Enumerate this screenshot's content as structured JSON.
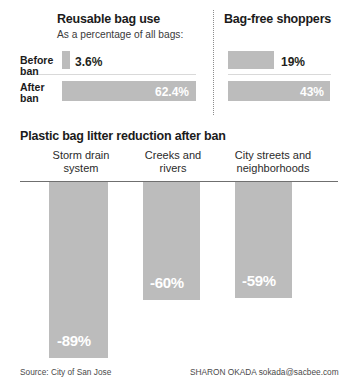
{
  "chart_data": [
    {
      "type": "bar",
      "orientation": "horizontal",
      "title": "Reusable bag use",
      "subtitle": "As a percentage of all bags:",
      "xlabel": "",
      "ylabel": "",
      "categories": [
        "Before ban",
        "After ban"
      ],
      "values": [
        3.6,
        62.4
      ],
      "value_labels": [
        "3.6%",
        "62.4%"
      ],
      "unit": "%",
      "xlim": [
        0,
        100
      ],
      "grid": false,
      "legend": "none",
      "bar_color": "#bcbcbc"
    },
    {
      "type": "bar",
      "orientation": "horizontal",
      "title": "Bag-free shoppers",
      "subtitle": "",
      "xlabel": "",
      "ylabel": "",
      "categories": [
        "Before ban",
        "After ban"
      ],
      "values": [
        19,
        43
      ],
      "value_labels": [
        "19%",
        "43%"
      ],
      "unit": "%",
      "xlim": [
        0,
        100
      ],
      "grid": false,
      "legend": "none",
      "bar_color": "#bcbcbc"
    },
    {
      "type": "bar",
      "orientation": "vertical",
      "title": "Plastic bag litter reduction after ban",
      "xlabel": "",
      "ylabel": "",
      "categories": [
        "Storm drain system",
        "Creeks and rivers",
        "City streets and neighborhoods"
      ],
      "values": [
        -89,
        -60,
        -59
      ],
      "value_labels": [
        "-89%",
        "-60%",
        "-59%"
      ],
      "unit": "%",
      "ylim": [
        -100,
        0
      ],
      "grid": false,
      "legend": "none",
      "bar_color": "#bcbcbc"
    }
  ],
  "top": {
    "left_panel": {
      "title": "Reusable bag use",
      "subtitle": "As a percentage of all bags:",
      "rows": [
        {
          "label": "Before\nban",
          "label_line1": "Before",
          "label_line2": "ban",
          "value_label": "3.6%"
        },
        {
          "label": "After\nban",
          "label_line1": "After",
          "label_line2": "ban",
          "value_label": "62.4%"
        }
      ]
    },
    "right_panel": {
      "title": "Bag-free shoppers",
      "rows": [
        {
          "value_label": "19%"
        },
        {
          "value_label": "43%"
        }
      ]
    }
  },
  "bottom": {
    "title": "Plastic bag litter reduction after ban",
    "categories": [
      {
        "line1": "Storm drain",
        "line2": "system",
        "value_label": "-89%"
      },
      {
        "line1": "Creeks and",
        "line2": "rivers",
        "value_label": "-60%"
      },
      {
        "line1": "City streets and",
        "line2": "neighborhoods",
        "value_label": "-59%"
      }
    ]
  },
  "footer": {
    "source": "Source: City of San Jose",
    "credit": "SHARON OKADA sokada@sacbee.com"
  },
  "colors": {
    "bar": "#bcbcbc",
    "text": "#231f20",
    "baseline": "#6f6f6f",
    "divider": "#8d8d8d"
  }
}
